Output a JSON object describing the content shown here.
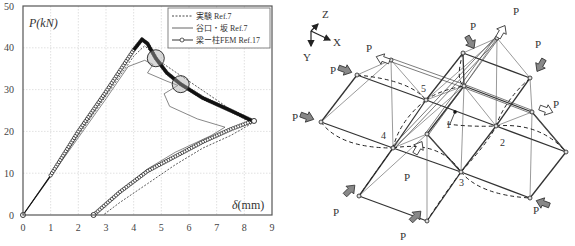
{
  "chart_data": {
    "type": "line",
    "title": "",
    "xlabel": "δ (mm)",
    "ylabel": "P(kN)",
    "xlim": [
      0,
      9
    ],
    "ylim": [
      0,
      50
    ],
    "x_ticks": [
      "0",
      "1",
      "2",
      "3",
      "4",
      "5",
      "6",
      "7",
      "8",
      "9"
    ],
    "y_ticks": [
      "0",
      "10",
      "20",
      "30",
      "40",
      "50"
    ],
    "grid": true,
    "legend_position": "upper right",
    "series": [
      {
        "name": "実験 Ref.7",
        "style": "dashed",
        "points": [
          [
            0,
            0
          ],
          [
            1,
            9.5
          ],
          [
            2,
            19
          ],
          [
            3,
            28.5
          ],
          [
            4,
            38
          ],
          [
            4.4,
            40.5
          ],
          [
            5,
            36.5
          ],
          [
            6,
            32
          ],
          [
            7,
            27.5
          ],
          [
            8,
            23
          ],
          [
            8.3,
            22
          ],
          [
            7.5,
            19
          ],
          [
            6.5,
            16
          ],
          [
            5.5,
            12
          ],
          [
            4.5,
            7.5
          ],
          [
            3.5,
            3
          ],
          [
            2.9,
            0
          ]
        ]
      },
      {
        "name": "谷口・坂 Ref.7",
        "style": "solid-thin",
        "points": [
          [
            0,
            0
          ],
          [
            1,
            9.2
          ],
          [
            2,
            18.5
          ],
          [
            3,
            27.8
          ],
          [
            3.8,
            35.5
          ],
          [
            4.4,
            37
          ],
          [
            4.7,
            36
          ],
          [
            4.5,
            34
          ],
          [
            5.2,
            32
          ],
          [
            5.6,
            31
          ],
          [
            5.1,
            29
          ],
          [
            5.3,
            26
          ],
          [
            6.3,
            23
          ],
          [
            7.3,
            21
          ],
          [
            6.8,
            19
          ],
          [
            5.5,
            15
          ],
          [
            4.5,
            11
          ],
          [
            3.5,
            5.5
          ],
          [
            2.6,
            0
          ]
        ]
      },
      {
        "name": "梁ー柱FEM Ref.17",
        "style": "solid-circle-markers",
        "points": [
          [
            0,
            0
          ],
          [
            1,
            9.5
          ],
          [
            2,
            20
          ],
          [
            3,
            29.5
          ],
          [
            4,
            39.5
          ],
          [
            4.3,
            42
          ],
          [
            4.5,
            41
          ],
          [
            4.8,
            37.5
          ],
          [
            5.2,
            34
          ],
          [
            5.7,
            31.3
          ],
          [
            6.5,
            28
          ],
          [
            7.5,
            25
          ],
          [
            8.3,
            22.5
          ],
          [
            7.5,
            20.5
          ],
          [
            6.5,
            17.5
          ],
          [
            5.5,
            14
          ],
          [
            4.5,
            10.5
          ],
          [
            3.5,
            5.5
          ],
          [
            2.55,
            0
          ]
        ],
        "highlight_circles": [
          [
            4.8,
            37.5
          ],
          [
            5.7,
            31.3
          ]
        ]
      }
    ]
  },
  "legend": {
    "items": [
      {
        "label": "実験 Ref.7"
      },
      {
        "label": "谷口・坂 Ref.7"
      },
      {
        "label": "梁ー柱FEM Ref.17"
      }
    ]
  },
  "chart_labels": {
    "y_axis_label": "P(kN)",
    "x_axis_label_symbol": "δ",
    "x_axis_label_unit": "(mm)"
  },
  "diagram": {
    "axes": {
      "z": "Z",
      "x": "X",
      "y": "Y"
    },
    "node_labels": [
      "1",
      "2",
      "3",
      "4",
      "5"
    ],
    "load_label": "P"
  }
}
